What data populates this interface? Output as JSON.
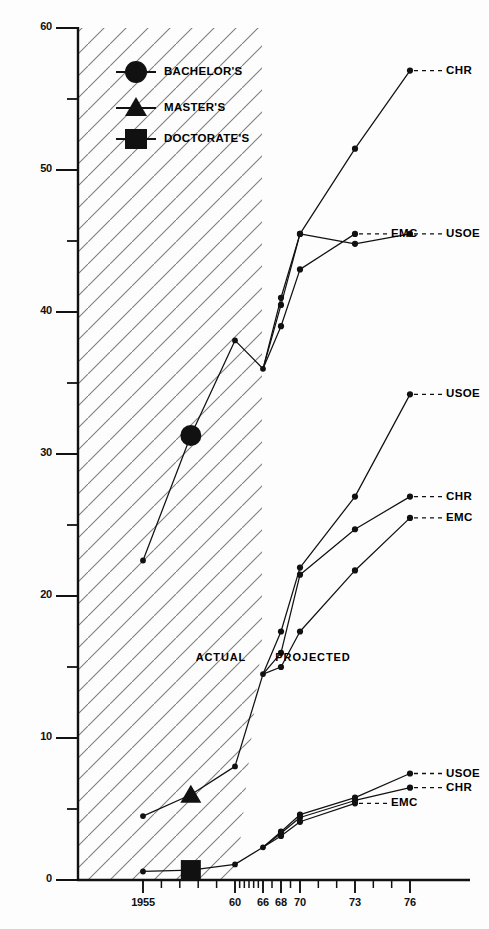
{
  "chart_data": {
    "type": "line",
    "title": "",
    "xlabel": "",
    "ylabel": "",
    "xlim": [
      1954,
      1977
    ],
    "ylim": [
      0,
      60
    ],
    "grid": false,
    "legend_position": "top-left",
    "y_ticks_major": [
      0,
      10,
      20,
      30,
      40,
      50,
      60
    ],
    "y_tick_labels": [
      "0",
      "10",
      "20",
      "30",
      "40",
      "50",
      "60"
    ],
    "y_ticks_minor": [
      5,
      15,
      25,
      35,
      45,
      55
    ],
    "x_ticks_labeled": [
      1955,
      1960,
      1966,
      1968,
      1970,
      1973,
      1976
    ],
    "x_tick_labels": [
      "1955",
      "60",
      "66",
      "68",
      "70",
      "73",
      "76"
    ],
    "x_ticks_minor": [
      1956,
      1957,
      1958,
      1959,
      1961,
      1962,
      1963,
      1964,
      1965,
      1967,
      1969,
      1971,
      1972,
      1974,
      1975
    ],
    "legend": [
      {
        "marker": "circle",
        "label": "BACHELOR'S"
      },
      {
        "marker": "triangle",
        "label": "MASTER'S"
      },
      {
        "marker": "square",
        "label": "DOCTORATE'S"
      }
    ],
    "annotations": [
      {
        "text": "ACTUAL",
        "x": 1959.6,
        "y": 15.6
      },
      {
        "text": "PROJECTED",
        "x": 1970.4,
        "y": 15.6
      }
    ],
    "groups": [
      {
        "name": "BACHELOR'S",
        "marker": "circle",
        "actual": {
          "x": [
            1955,
            1957.6,
            1960,
            1966
          ],
          "y": [
            22.5,
            31.3,
            38.0,
            36.0
          ]
        },
        "big_marker": {
          "x": 1957.6,
          "y": 31.3
        },
        "projections": [
          {
            "name": "CHR",
            "x": [
              1966,
              1968,
              1970,
              1973,
              1976
            ],
            "y": [
              36.0,
              41.0,
              45.5,
              51.5,
              57.0
            ],
            "label": "CHR"
          },
          {
            "name": "USOE",
            "x": [
              1966,
              1968,
              1970,
              1973,
              1976
            ],
            "y": [
              36.0,
              40.5,
              45.5,
              44.8,
              45.5
            ],
            "label": "USOE"
          },
          {
            "name": "EMC",
            "x": [
              1966,
              1968,
              1970,
              1973
            ],
            "y": [
              36.0,
              39.0,
              43.0,
              45.5
            ],
            "label": "EMC"
          }
        ]
      },
      {
        "name": "MASTER'S",
        "marker": "triangle",
        "actual": {
          "x": [
            1955,
            1957.6,
            1960,
            1966
          ],
          "y": [
            4.5,
            6.0,
            8.0,
            14.5
          ]
        },
        "big_marker": {
          "x": 1957.6,
          "y": 6.0
        },
        "projections": [
          {
            "name": "USOE",
            "x": [
              1966,
              1968,
              1970,
              1973,
              1976
            ],
            "y": [
              14.5,
              17.5,
              22.0,
              27.0,
              34.2
            ],
            "label": "USOE"
          },
          {
            "name": "CHR",
            "x": [
              1966,
              1968,
              1970,
              1973,
              1976
            ],
            "y": [
              14.5,
              16.0,
              21.5,
              24.7,
              27.0
            ],
            "label": "CHR"
          },
          {
            "name": "EMC",
            "x": [
              1966,
              1968,
              1970,
              1973,
              1976
            ],
            "y": [
              14.5,
              15.0,
              17.5,
              21.8,
              25.5
            ],
            "label": "EMC"
          }
        ]
      },
      {
        "name": "DOCTORATE'S",
        "marker": "square",
        "actual": {
          "x": [
            1955,
            1957.6,
            1960,
            1966
          ],
          "y": [
            0.6,
            0.7,
            1.1,
            2.3
          ]
        },
        "big_marker": {
          "x": 1957.6,
          "y": 0.7
        },
        "projections": [
          {
            "name": "USOE",
            "x": [
              1966,
              1968,
              1970,
              1973,
              1976
            ],
            "y": [
              2.3,
              3.4,
              4.6,
              5.8,
              7.5
            ],
            "label": "USOE"
          },
          {
            "name": "CHR",
            "x": [
              1966,
              1968,
              1970,
              1973,
              1976
            ],
            "y": [
              2.3,
              3.3,
              4.4,
              5.6,
              6.5
            ],
            "label": "CHR"
          },
          {
            "name": "EMC",
            "x": [
              1966,
              1968,
              1970,
              1973
            ],
            "y": [
              2.3,
              3.1,
              4.1,
              5.4
            ],
            "label": "EMC"
          }
        ]
      }
    ],
    "colors": {
      "line": "#111111",
      "axis": "#111111",
      "hatch": "#7d7d7d",
      "background": "#fdfdfd"
    }
  }
}
